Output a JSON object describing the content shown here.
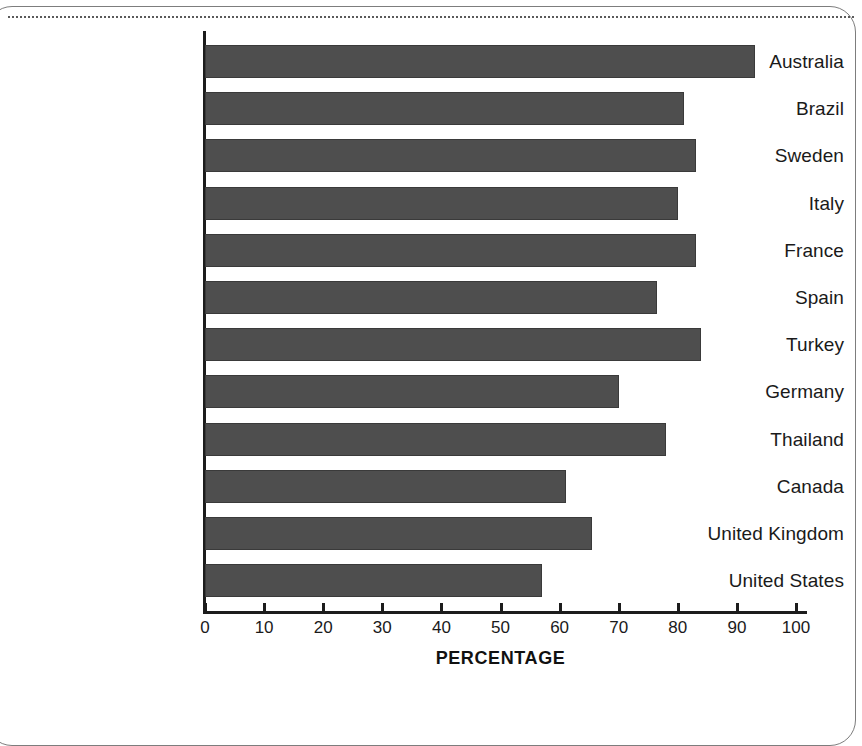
{
  "chart_data": {
    "type": "bar",
    "orientation": "horizontal",
    "title": "",
    "xlabel": "PERCENTAGE",
    "ylabel": "",
    "xlim": [
      0,
      100
    ],
    "xticks": [
      "0",
      "10",
      "20",
      "30",
      "40",
      "50",
      "60",
      "70",
      "80",
      "90",
      "100"
    ],
    "grid": false,
    "legend": null,
    "bar_color": "#4e4e4e",
    "categories": [
      "Australia",
      "Brazil",
      "Sweden",
      "Italy",
      "France",
      "Spain",
      "Turkey",
      "Germany",
      "Thailand",
      "Canada",
      "United Kingdom",
      "United States"
    ],
    "values": [
      93,
      81,
      83,
      80,
      83,
      76.5,
      84,
      70,
      78,
      61,
      65.5,
      57
    ]
  }
}
